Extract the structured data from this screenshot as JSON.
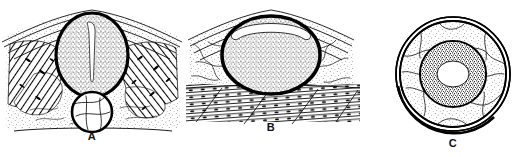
{
  "figure": {
    "style": "pen-and-ink stipple and hatch illustration",
    "background_color": "#ffffff",
    "ink_color": "#000000",
    "width_px": 521,
    "height_px": 157,
    "panel_count": 3
  },
  "panels": [
    {
      "id": "A",
      "label": "A",
      "caption": "",
      "description": "Transverse section: central oval organ with thick dark capsule, dense radially striated cortex and a narrow vertical slit-like central canal; smaller round structure with thick rim below; surrounding fascial sheets above and obliquely hatched muscle bundles at both sides.",
      "features": [
        "peaked fascial layers",
        "oval organ with thick capsule",
        "vertical slit central canal",
        "radial cortical striation",
        "hatched muscle with dark nuclei",
        "small circular structure below",
        "stippled loose tissue",
        "horizontal baseline"
      ]
    },
    {
      "id": "B",
      "label": "B",
      "caption": "",
      "description": "Transverse section: rounded oval organ with very thick dark capsule, crescent-shaped pale cleft beneath the upper capsule and vertically streaked stippled interior; surrounded by finely stippled fissured areolar tissue and a band of horizontally striated muscle fibres with oval nuclei below.",
      "features": [
        "peaked fascial layers",
        "thick dark capsule",
        "crescentic pale cleft",
        "vertically streaked stipple",
        "fissured areolar tissue",
        "striated muscle band with nuclei"
      ]
    },
    {
      "id": "C",
      "label": "C",
      "caption": "",
      "description": "Circular transverse section: concentric double outer ring, an outer zone of pale stippled tissue crossed by irregular crack-like fissures, a thin dark ring, a dense stippled annulus and a pale oval centre.",
      "features": [
        "double outer ring",
        "fissured pale outer zone",
        "thin dark ring",
        "dense stippled annulus",
        "pale oval centre"
      ]
    }
  ],
  "labels": {
    "a": "A",
    "b": "B",
    "c": "C"
  }
}
